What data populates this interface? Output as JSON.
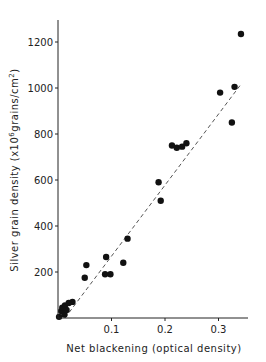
{
  "chart_data": {
    "type": "scatter",
    "title": "",
    "xlabel": "Net blackening (optical density)",
    "ylabel": "Silver grain density (x10^6 grains/cm^2)",
    "ylabel_parts": {
      "main": "Silver grain density (x10",
      "sup1": "6",
      "mid": "grains/cm",
      "sup2": "2",
      "end": ")"
    },
    "xlim": [
      0,
      0.36
    ],
    "ylim": [
      0,
      1300
    ],
    "x_ticks": [
      0.1,
      0.2,
      0.3
    ],
    "x_tick_labels": [
      "0.1",
      "0.2",
      "0.3"
    ],
    "y_ticks": [
      200,
      400,
      600,
      800,
      1000,
      1200
    ],
    "y_tick_labels": [
      "200",
      "400",
      "600",
      "800",
      "1000",
      "1200"
    ],
    "grid": false,
    "legend": null,
    "series": [
      {
        "name": "measurements",
        "marker": "filled-circle",
        "color": "#111111",
        "points": [
          {
            "x": 0.002,
            "y": 5
          },
          {
            "x": 0.006,
            "y": 30
          },
          {
            "x": 0.008,
            "y": 45
          },
          {
            "x": 0.012,
            "y": 15
          },
          {
            "x": 0.013,
            "y": 55
          },
          {
            "x": 0.016,
            "y": 35
          },
          {
            "x": 0.02,
            "y": 65
          },
          {
            "x": 0.027,
            "y": 70
          },
          {
            "x": 0.05,
            "y": 175
          },
          {
            "x": 0.053,
            "y": 230
          },
          {
            "x": 0.088,
            "y": 190
          },
          {
            "x": 0.09,
            "y": 265
          },
          {
            "x": 0.098,
            "y": 190
          },
          {
            "x": 0.122,
            "y": 240
          },
          {
            "x": 0.13,
            "y": 345
          },
          {
            "x": 0.188,
            "y": 590
          },
          {
            "x": 0.192,
            "y": 510
          },
          {
            "x": 0.213,
            "y": 750
          },
          {
            "x": 0.222,
            "y": 740
          },
          {
            "x": 0.232,
            "y": 745
          },
          {
            "x": 0.24,
            "y": 760
          },
          {
            "x": 0.303,
            "y": 980
          },
          {
            "x": 0.325,
            "y": 850
          },
          {
            "x": 0.33,
            "y": 1005
          },
          {
            "x": 0.342,
            "y": 1235
          }
        ]
      }
    ],
    "fit_line": {
      "style": "dashed",
      "color": "#555555",
      "from": {
        "x": 0.0,
        "y": -40
      },
      "to": {
        "x": 0.34,
        "y": 1010
      }
    }
  }
}
